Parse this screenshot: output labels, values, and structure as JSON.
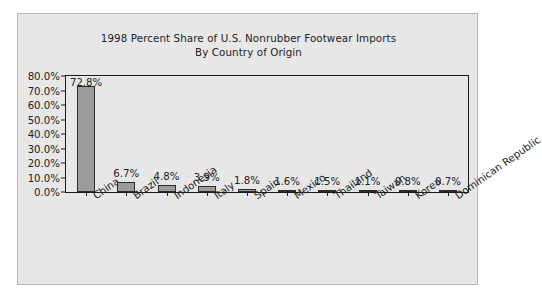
{
  "chart_data": {
    "type": "bar",
    "title": "1998 Percent Share of U.S. Nonrubber Footwear Imports By Country of Origin",
    "title_lines": [
      "1998 Percent Share of U.S. Nonrubber Footwear Imports",
      "By Country of Origin"
    ],
    "xlabel": "",
    "ylabel": "",
    "categories": [
      "China",
      "Brazil",
      "Indonesia",
      "Italy",
      "Spain",
      "Mexico",
      "Thailand",
      "Taiwan",
      "Korea",
      "Dominican Republic"
    ],
    "values": [
      72.8,
      6.7,
      4.8,
      3.9,
      1.8,
      1.6,
      1.5,
      1.1,
      0.8,
      0.7
    ],
    "data_labels": [
      "72.8%",
      "6.7%",
      "4.8%",
      "3.9%",
      "1.8%",
      "1.6%",
      "1.5%",
      "1.1%",
      "0.8%",
      "0.7%"
    ],
    "ylim": [
      0,
      80
    ],
    "ytick_values": [
      0,
      10,
      20,
      30,
      40,
      50,
      60,
      70,
      80
    ],
    "ytick_labels": [
      "0.0%",
      "10.0%",
      "20.0%",
      "30.0%",
      "40.0%",
      "50.0%",
      "60.0%",
      "70.0%",
      "80.0%"
    ],
    "grid": false,
    "legend": false,
    "legend_position": "none",
    "bar_color": "#9c9c9c",
    "bar_edge_color": "#2a2a2a",
    "axis_color": "#1a1a1a",
    "text_color": "#232323",
    "plot_background": "#e7e7e7",
    "figure_background": "#ffffff"
  }
}
